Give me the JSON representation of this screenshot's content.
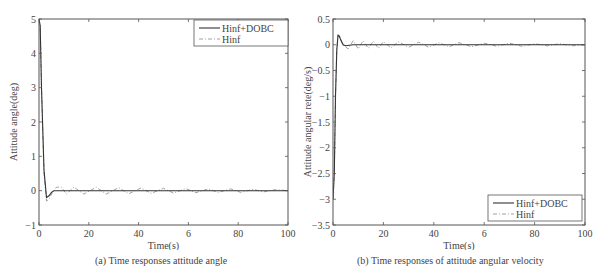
{
  "chart_data": [
    {
      "type": "line",
      "title": "",
      "caption": "(a) Time responses attitude angle",
      "xlabel": "Time(s)",
      "ylabel": "Attitude angle(deg)",
      "xlim": [
        0,
        100
      ],
      "ylim": [
        -1,
        5
      ],
      "xticks": [
        0,
        20,
        40,
        60,
        80,
        100
      ],
      "xtick_labels": [
        "0",
        "20",
        "40",
        "6",
        "80",
        "100"
      ],
      "yticks": [
        -1,
        0,
        1,
        2,
        3,
        4,
        5
      ],
      "ytick_labels": [
        "-1",
        "0",
        "1",
        "2",
        "3",
        "4",
        "5"
      ],
      "grid": false,
      "legend_position": "upper right",
      "series": [
        {
          "name": "Hinf+DOBC",
          "style": "solid",
          "x": [
            0,
            0.5,
            1,
            2,
            3,
            4,
            5,
            6,
            8,
            10,
            20,
            40,
            60,
            80,
            100
          ],
          "y": [
            5,
            4.8,
            3.0,
            0.6,
            -0.2,
            -0.15,
            -0.05,
            0,
            0,
            0,
            0,
            0,
            0,
            0,
            0
          ]
        },
        {
          "name": "Hinf",
          "style": "dashdot",
          "x": [
            0,
            0.5,
            1,
            2,
            3,
            4,
            5,
            7,
            9,
            11,
            14,
            18,
            23,
            27,
            32,
            36,
            41,
            45,
            50,
            54,
            59,
            63,
            68,
            72,
            77,
            81,
            86,
            90,
            95,
            100
          ],
          "y": [
            5,
            4.8,
            3.0,
            0.5,
            -0.3,
            -0.25,
            -0.1,
            0.1,
            0.1,
            -0.1,
            0.1,
            -0.1,
            0.1,
            -0.1,
            0.09,
            -0.09,
            0.08,
            -0.08,
            0.07,
            -0.07,
            0.06,
            -0.06,
            0.05,
            -0.05,
            0.05,
            -0.05,
            0.04,
            -0.04,
            0.03,
            0
          ]
        }
      ]
    },
    {
      "type": "line",
      "title": "",
      "caption": "(b) Time responses of attitude angular velocity",
      "xlabel": "Time(s)",
      "ylabel": "Attitude angular rete(deg/s)",
      "xlim": [
        0,
        100
      ],
      "ylim": [
        -3.5,
        0.5
      ],
      "xticks": [
        0,
        20,
        40,
        60,
        80,
        100
      ],
      "xtick_labels": [
        "0",
        "20",
        "40",
        "6",
        "80",
        "100"
      ],
      "yticks": [
        -3.5,
        -3,
        -2.5,
        -2,
        -1.5,
        -1,
        -0.5,
        0,
        0.5
      ],
      "ytick_labels": [
        "-3.5",
        "-3",
        "-2.5",
        "-2",
        "-1.5",
        "-1",
        "-0.5",
        "0",
        "0.5"
      ],
      "grid": false,
      "legend_position": "lower right",
      "series": [
        {
          "name": "Hinf+DOBC",
          "style": "solid",
          "x": [
            0,
            0.5,
            1,
            1.5,
            2,
            2.5,
            3,
            4,
            5,
            8,
            20,
            40,
            60,
            80,
            100
          ],
          "y": [
            -3.0,
            -2.5,
            -1.0,
            -0.1,
            0.18,
            0.17,
            0.1,
            0.0,
            -0.02,
            0,
            0,
            0,
            0,
            0,
            0
          ]
        },
        {
          "name": "Hinf",
          "style": "dashdot",
          "x": [
            0,
            0.5,
            1,
            1.5,
            2,
            2.5,
            3,
            4,
            6,
            8,
            10,
            12,
            14,
            16,
            18,
            20,
            23,
            26,
            30,
            34,
            38,
            42,
            46,
            50,
            55,
            60,
            65,
            70,
            75,
            80,
            85,
            90,
            95,
            100
          ],
          "y": [
            -3.0,
            -2.5,
            -1.0,
            -0.1,
            0.2,
            0.18,
            0.1,
            0.0,
            -0.08,
            0.08,
            -0.08,
            0.08,
            -0.07,
            0.07,
            -0.07,
            0.06,
            -0.06,
            0.06,
            -0.05,
            0.05,
            -0.05,
            0.04,
            -0.04,
            0.04,
            -0.04,
            0.03,
            -0.03,
            0.03,
            -0.03,
            0.02,
            -0.02,
            0.02,
            -0.02,
            0
          ]
        }
      ]
    }
  ],
  "figures": {
    "a": {
      "caption": "(a) Time responses attitude angle",
      "xlabel": "Time(s)",
      "ylabel": "Attitude angle(deg)",
      "legend": [
        "Hinf+DOBC",
        "Hinf"
      ]
    },
    "b": {
      "caption": "(b) Time responses of attitude angular velocity",
      "xlabel": "Time(s)",
      "ylabel": "Attitude angular rete(deg/s)",
      "legend": [
        "Hinf+DOBC",
        "Hinf"
      ]
    }
  },
  "colors": {
    "axis": "#555555",
    "series_solid": "#333333",
    "series_dashdot": "#888888",
    "text": "#444444"
  }
}
